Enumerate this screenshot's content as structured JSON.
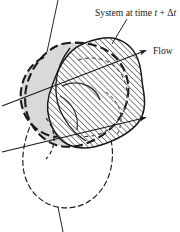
{
  "figure": {
    "name": "system-at-time-t-plus-delta-t",
    "type": "technical-diagram",
    "background_color": "#ffffff",
    "labels": {
      "system_label_prefix": "System at time ",
      "system_label_var1": "t",
      "system_label_operator": " + ",
      "system_label_delta": "Δ",
      "system_label_var2": "t",
      "flow_label": "Flow"
    },
    "regions": [
      {
        "id": "system-initial",
        "name": "system-region-initial",
        "fill": "#d9d9d9",
        "stroke": "#1a1a1a",
        "stroke_style": "dashed-heavy",
        "description": "Shaded blob representing the system at the earlier time"
      },
      {
        "id": "system-final",
        "name": "system-region-final",
        "fill": "hatch",
        "stroke": "#1a1a1a",
        "stroke_style": "solid",
        "description": "Hatched blob representing the system at time t + delta t"
      },
      {
        "id": "system-lower-dashed",
        "name": "system-region-lower-dashed",
        "fill": "none",
        "stroke": "#1a1a1a",
        "stroke_style": "dashed-thin",
        "description": "Thin dashed lower lobe outline"
      }
    ],
    "arrows": [
      {
        "id": "flow-arrow-upper",
        "name": "flow-arrow-upper",
        "from_x": 2,
        "from_y": 106,
        "to_x": 148,
        "to_y": 50,
        "color": "#1a1a1a"
      },
      {
        "id": "flow-arrow-lower",
        "name": "flow-arrow-lower",
        "from_x": 2,
        "from_y": 152,
        "to_x": 148,
        "to_y": 117,
        "color": "#1a1a1a"
      }
    ],
    "leader_lines": [
      {
        "id": "leader-top",
        "name": "leader-line-top",
        "from_x": 58,
        "from_y": 0,
        "to_x": 47,
        "to_y": 52
      },
      {
        "id": "leader-system-label",
        "name": "leader-line-system-label",
        "from_x": 127,
        "from_y": 19,
        "to_x": 112,
        "to_y": 44
      },
      {
        "id": "leader-bottom",
        "name": "leader-line-bottom",
        "from_x": 58,
        "from_y": 207,
        "to_x": 63,
        "to_y": 232
      }
    ],
    "colors": {
      "ink": "#1a1a1a",
      "shade": "#d9d9d9",
      "hatch": "#2b2b2b",
      "paper": "#ffffff"
    }
  }
}
